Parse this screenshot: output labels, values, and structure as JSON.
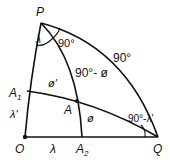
{
  "diagram": {
    "type": "spherical-triangle-geometry",
    "points": {
      "P": {
        "label": "P",
        "x": 41,
        "y": 23
      },
      "O": {
        "label": "O",
        "x": 25,
        "y": 137
      },
      "Q": {
        "label": "Q",
        "x": 158,
        "y": 137
      },
      "A": {
        "label": "A",
        "x": 77,
        "y": 101
      },
      "A1": {
        "label": "A",
        "sub": "1",
        "x": 27,
        "y": 91
      },
      "A2": {
        "label": "A",
        "sub": "2",
        "x": 82,
        "y": 137
      }
    },
    "labels": {
      "angle_at_P": "λ",
      "right_angle_at_P": "90°",
      "arc_PQ": "90°",
      "arc_PA": "90°- ø",
      "arc_A1P": "ø'",
      "arc_AA2": "ø",
      "segment_OA1": "λ'",
      "segment_OA2": "λ",
      "angle_at_Q": "90°-λ'"
    }
  }
}
